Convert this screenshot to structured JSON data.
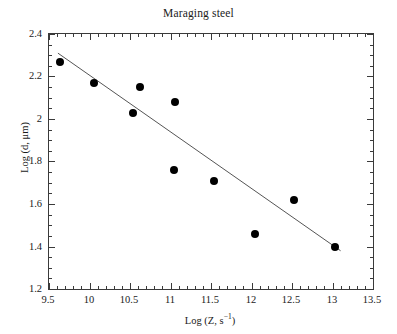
{
  "chart_data": {
    "type": "scatter",
    "title": "Maraging steel",
    "xlabel": "Log (Z, s⁻¹)",
    "ylabel": "Log (d, μm)",
    "xlim": [
      9.5,
      13.5
    ],
    "ylim": [
      1.2,
      2.4
    ],
    "xticks": [
      9.5,
      10,
      10.5,
      11,
      11.5,
      12,
      12.5,
      13,
      13.5
    ],
    "xtick_labels": [
      "9.5",
      "10",
      "10.5",
      "11",
      "11.5",
      "12",
      "12.5",
      "13",
      "13.5"
    ],
    "yticks": [
      1.2,
      1.4,
      1.6,
      1.8,
      2.0,
      2.2,
      2.4
    ],
    "ytick_labels": [
      "1.2",
      "1.4",
      "1.6",
      "1.8",
      "2",
      "2.2",
      "2.4"
    ],
    "x_minor_per_major": 5,
    "y_minor_per_major": 4,
    "grid": false,
    "legend": null,
    "marker": {
      "shape": "circle",
      "color": "#000000",
      "size_px": 8
    },
    "points": [
      {
        "x": 9.64,
        "y": 2.27
      },
      {
        "x": 10.06,
        "y": 2.17
      },
      {
        "x": 10.54,
        "y": 2.03
      },
      {
        "x": 10.62,
        "y": 2.15
      },
      {
        "x": 11.04,
        "y": 1.76
      },
      {
        "x": 11.06,
        "y": 2.08
      },
      {
        "x": 11.54,
        "y": 1.71
      },
      {
        "x": 12.04,
        "y": 1.46
      },
      {
        "x": 12.52,
        "y": 1.62
      },
      {
        "x": 13.03,
        "y": 1.4
      }
    ],
    "fit_line": {
      "type": "linear",
      "color": "#555555",
      "width_px": 1,
      "x_start": 9.61,
      "y_start": 2.31,
      "x_end": 13.1,
      "y_end": 1.38
    }
  }
}
